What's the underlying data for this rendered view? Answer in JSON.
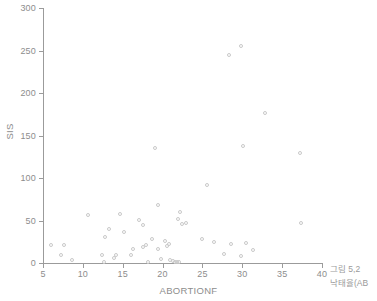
{
  "figure": {
    "caption_line1": "그림 5,2",
    "caption_line2": "낙태율(AB"
  },
  "chart_data": {
    "type": "scatter",
    "title": "",
    "xlabel": "ABORTIONF",
    "ylabel": "SIS",
    "xlim": [
      5,
      40
    ],
    "ylim": [
      0,
      300
    ],
    "xticks": [
      5,
      10,
      15,
      20,
      25,
      30,
      35,
      40
    ],
    "yticks": [
      0,
      50,
      100,
      150,
      200,
      250,
      300
    ],
    "xtick_labels": [
      "5",
      "10",
      "15",
      "20",
      "25",
      "30",
      "35",
      "40"
    ],
    "ytick_labels": [
      "0",
      "50",
      "100",
      "150",
      "200",
      "250",
      "300"
    ],
    "grid": false,
    "legend": null,
    "marker": {
      "shape": "open-circle",
      "color": "#c9c9c9",
      "size": 4
    },
    "points": [
      {
        "x": 6.0,
        "y": 21
      },
      {
        "x": 7.3,
        "y": 9
      },
      {
        "x": 7.6,
        "y": 21
      },
      {
        "x": 8.6,
        "y": 3
      },
      {
        "x": 10.6,
        "y": 56
      },
      {
        "x": 12.4,
        "y": 10
      },
      {
        "x": 12.6,
        "y": 1
      },
      {
        "x": 12.8,
        "y": 31
      },
      {
        "x": 13.3,
        "y": 40
      },
      {
        "x": 13.9,
        "y": 6
      },
      {
        "x": 14.2,
        "y": 10
      },
      {
        "x": 14.6,
        "y": 58
      },
      {
        "x": 15.1,
        "y": 36
      },
      {
        "x": 16.0,
        "y": 10
      },
      {
        "x": 16.3,
        "y": 17
      },
      {
        "x": 17.0,
        "y": 51
      },
      {
        "x": 17.6,
        "y": 45
      },
      {
        "x": 17.6,
        "y": 19
      },
      {
        "x": 17.9,
        "y": 21
      },
      {
        "x": 18.2,
        "y": 1
      },
      {
        "x": 18.7,
        "y": 28
      },
      {
        "x": 19.1,
        "y": 135
      },
      {
        "x": 19.4,
        "y": 68
      },
      {
        "x": 19.4,
        "y": 16
      },
      {
        "x": 19.8,
        "y": 5
      },
      {
        "x": 20.3,
        "y": 26
      },
      {
        "x": 20.6,
        "y": 20
      },
      {
        "x": 20.8,
        "y": 22
      },
      {
        "x": 20.9,
        "y": 3
      },
      {
        "x": 21.3,
        "y": 2
      },
      {
        "x": 21.6,
        "y": 1
      },
      {
        "x": 21.8,
        "y": 1
      },
      {
        "x": 22.0,
        "y": 1
      },
      {
        "x": 21.9,
        "y": 52
      },
      {
        "x": 22.2,
        "y": 60
      },
      {
        "x": 22.4,
        "y": 46
      },
      {
        "x": 23.0,
        "y": 47
      },
      {
        "x": 24.9,
        "y": 28
      },
      {
        "x": 25.6,
        "y": 92
      },
      {
        "x": 26.4,
        "y": 25
      },
      {
        "x": 27.7,
        "y": 11
      },
      {
        "x": 28.3,
        "y": 245
      },
      {
        "x": 28.6,
        "y": 22
      },
      {
        "x": 29.9,
        "y": 255
      },
      {
        "x": 29.8,
        "y": 8
      },
      {
        "x": 30.1,
        "y": 138
      },
      {
        "x": 30.5,
        "y": 23
      },
      {
        "x": 31.3,
        "y": 15
      },
      {
        "x": 32.8,
        "y": 176
      },
      {
        "x": 37.3,
        "y": 130
      },
      {
        "x": 37.4,
        "y": 47
      }
    ]
  }
}
